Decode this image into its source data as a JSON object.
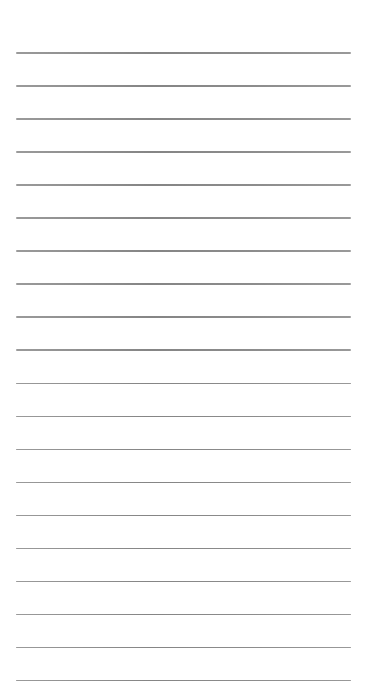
{
  "page": {
    "type": "ruled-notepad",
    "background_color": "#ffffff",
    "line_color": "#8a8a8a",
    "line_count": 20,
    "first_line_y": 52,
    "line_spacing": 33.05,
    "line_left": 16,
    "line_width": 335,
    "lines": [
      {
        "text": ""
      },
      {
        "text": ""
      },
      {
        "text": ""
      },
      {
        "text": ""
      },
      {
        "text": ""
      },
      {
        "text": ""
      },
      {
        "text": ""
      },
      {
        "text": ""
      },
      {
        "text": ""
      },
      {
        "text": ""
      },
      {
        "text": ""
      },
      {
        "text": ""
      },
      {
        "text": ""
      },
      {
        "text": ""
      },
      {
        "text": ""
      },
      {
        "text": ""
      },
      {
        "text": ""
      },
      {
        "text": ""
      },
      {
        "text": ""
      },
      {
        "text": ""
      }
    ]
  }
}
